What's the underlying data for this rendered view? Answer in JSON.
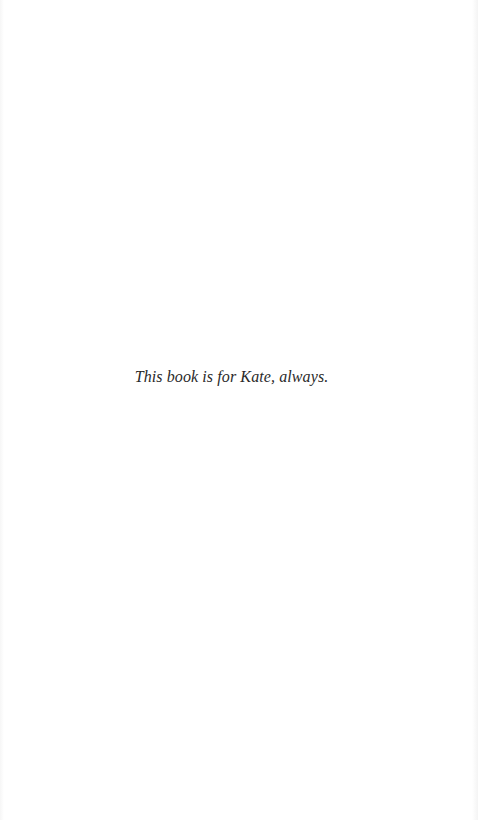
{
  "page": {
    "dedication": "This book is for Kate, always."
  }
}
